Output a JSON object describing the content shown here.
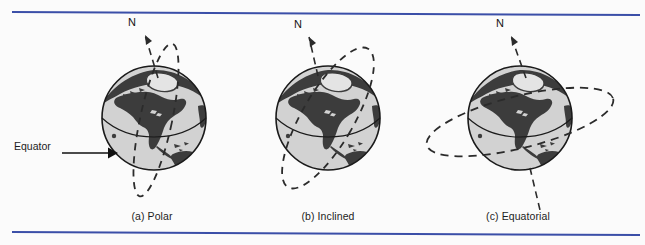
{
  "figure": {
    "background_color": "#fbfbfb",
    "rule_color": "#3b4fa8",
    "globe_ocean_color": "#d0d0d0",
    "globe_land_color": "#3c3c3c",
    "globe_outline_color": "#1a1a1a",
    "orbit_color": "#2b2b2b"
  },
  "annotations": {
    "equator_label": "Equator",
    "north_label": "N"
  },
  "panels": [
    {
      "id": "polar",
      "caption": "(a) Polar",
      "north_label": "N",
      "orbit_type": "polar",
      "orbit_description": "Dashed narrow ellipse passing over both poles"
    },
    {
      "id": "inclined",
      "caption": "(b) Inclined",
      "north_label": "N",
      "orbit_type": "inclined",
      "orbit_description": "Dashed ellipse tilted at an angle to the equator"
    },
    {
      "id": "equatorial",
      "caption": "(c) Equatorial",
      "north_label": "N",
      "orbit_type": "equatorial",
      "orbit_description": "Dashed wide ellipse lying in the equatorial plane"
    }
  ]
}
